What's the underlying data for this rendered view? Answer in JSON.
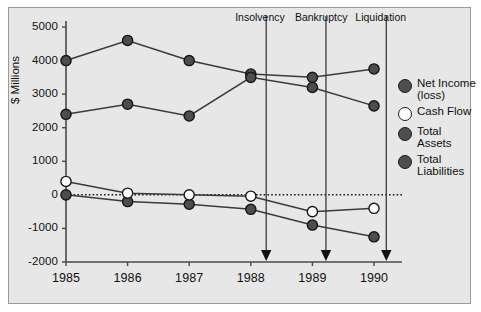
{
  "chart_data": {
    "type": "line",
    "title": "",
    "xlabel": "",
    "ylabel": "$ Millions",
    "categories": [
      "1985",
      "1986",
      "1987",
      "1988",
      "1989",
      "1990"
    ],
    "x": [
      1985,
      1986,
      1987,
      1988,
      1989,
      1990
    ],
    "ylim": [
      -2000,
      5000
    ],
    "yticks": [
      5000,
      4000,
      3000,
      2000,
      1000,
      0,
      -1000,
      -2000
    ],
    "ytick_labels": [
      "5000",
      "4000",
      "3000",
      "2000",
      "1000",
      "0",
      "-1000",
      "-2000"
    ],
    "xtick_labels": [
      "1985",
      "1986",
      "1987",
      "1988",
      "1989",
      "1990"
    ],
    "grid": false,
    "legend_position": "right",
    "zero_line": 0,
    "series": [
      {
        "name": "Net Income (loss)",
        "marker": "filled-dark-circle",
        "color": "#4d4d4d",
        "values": [
          0,
          -200,
          -280,
          -430,
          -900,
          -1250
        ]
      },
      {
        "name": "Cash Flow",
        "marker": "open-white-circle",
        "color": "#ffffff",
        "values": [
          400,
          50,
          0,
          -40,
          -500,
          -400
        ]
      },
      {
        "name": "Total Assets",
        "marker": "filled-dark-circle",
        "color": "#4d4d4d",
        "values": [
          4000,
          4600,
          4000,
          3600,
          3500,
          3750
        ]
      },
      {
        "name": "Total Liabilities",
        "marker": "filled-dark-circle",
        "color": "#4d4d4d",
        "values": [
          2400,
          2700,
          2350,
          3500,
          3200,
          2650
        ]
      }
    ],
    "annotations": [
      {
        "label": "Insolvency",
        "x": 1988.25
      },
      {
        "label": "Bankruptcy",
        "x": 1989.22
      },
      {
        "label": "Liquidation",
        "x": 1990.2
      }
    ]
  },
  "legend": {
    "items": [
      {
        "label": "Net Income (loss)",
        "marker": "filled"
      },
      {
        "label": "Cash Flow",
        "marker": "open"
      },
      {
        "label": "Total Assets",
        "marker": "filled"
      },
      {
        "label": "Total Liabilities",
        "marker": "filled"
      }
    ]
  },
  "colors": {
    "panel_background": "#e7e7e7",
    "panel_border": "#9a9a9a",
    "marker_fill": "#4d4d4d",
    "marker_open_fill": "#ffffff",
    "line": "#3a3a3a",
    "axis": "#4a4a4a",
    "text": "#111111"
  }
}
